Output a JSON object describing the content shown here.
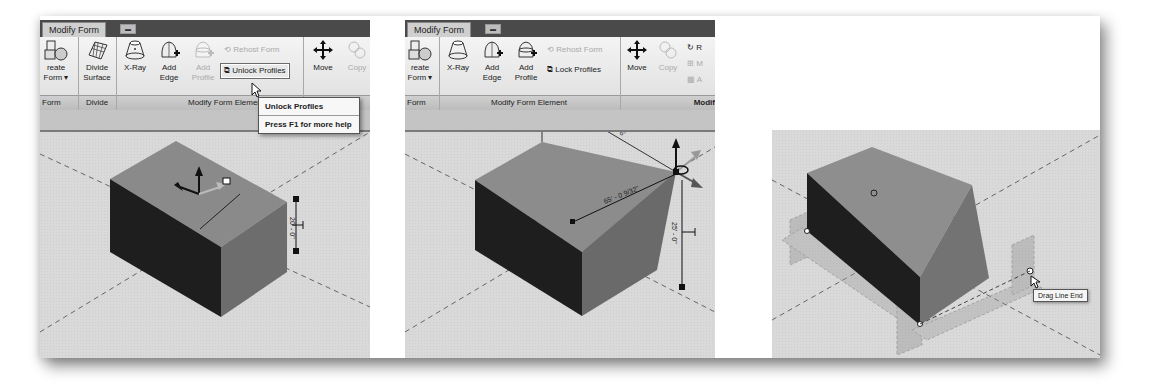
{
  "panels": [
    {
      "id": "before",
      "ribbon": {
        "tab_label": "Modify Form",
        "tools": {
          "create_form": "Create Form",
          "create_form_short": "reate",
          "create_form_line2": "Form",
          "divide_surface_l1": "Divide",
          "divide_surface_l2": "Surface",
          "xray": "X-Ray",
          "add_edge_l1": "Add",
          "add_edge_l2": "Edge",
          "add_profile_l1": "Add",
          "add_profile_l2": "Profile",
          "rehost_form": "Rehost Form",
          "unlock_profiles": "Unlock Profiles",
          "move": "Move",
          "copy": "Copy"
        },
        "groups": {
          "form": "Form",
          "divide": "Divide",
          "modify_form_element": "Modify Form Element"
        }
      },
      "tooltip": {
        "title": "Unlock Profiles",
        "help": "Press F1 for more help"
      },
      "dimension": "20' - 0\""
    },
    {
      "id": "unlocked",
      "ribbon": {
        "tab_label": "Modify Form",
        "tools": {
          "create_form_short": "reate",
          "create_form_line2": "Form",
          "xray": "X-Ray",
          "add_edge_l1": "Add",
          "add_edge_l2": "Edge",
          "add_profile_l1": "Add",
          "add_profile_l2": "Profile",
          "rehost_form": "Rehost Form",
          "lock_profiles": "Lock Profiles",
          "move": "Move",
          "copy": "Copy",
          "rotate_short": "R",
          "mirror_short": "M",
          "array_short": "A"
        },
        "groups": {
          "form": "Form",
          "modify_form_element": "Modify Form Element",
          "modify_short": "Modif"
        }
      },
      "dimensions": {
        "diagonal": "65' - 0 9/32\"",
        "vertical": "25' - 0\"",
        "top": "6'"
      }
    },
    {
      "id": "drag-line-end",
      "tooltip": "Drag Line End"
    }
  ],
  "colors": {
    "viewport_bg": "#d9d9d9",
    "ribbon_tab_bar": "#4a4a4a",
    "top_face": "#8a8a8a",
    "dark_face": "#1e1e1e",
    "side_face": "#6d6d6d"
  }
}
